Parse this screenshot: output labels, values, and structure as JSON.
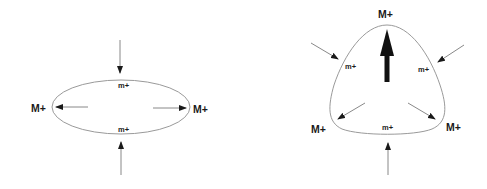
{
  "diagram": {
    "left_panel": {
      "shape": "ellipse",
      "labels": {
        "major_left": "M+",
        "major_right": "M+",
        "minor_top": "m+",
        "minor_bottom": "m+"
      },
      "arrows": [
        {
          "name": "compress-top",
          "direction": "inward"
        },
        {
          "name": "compress-bottom",
          "direction": "inward"
        },
        {
          "name": "expand-left",
          "direction": "outward"
        },
        {
          "name": "expand-right",
          "direction": "outward"
        }
      ]
    },
    "right_panel": {
      "shape": "rounded-triangle",
      "labels": {
        "major_top": "M+",
        "major_bottom_left": "M+",
        "major_bottom_right": "M+",
        "minor_left": "m+",
        "minor_right": "m+",
        "minor_bottom": "m+"
      },
      "arrows": [
        {
          "name": "thick-up",
          "direction": "outward",
          "style": "bold"
        },
        {
          "name": "compress-top-left",
          "direction": "inward"
        },
        {
          "name": "compress-top-right",
          "direction": "inward"
        },
        {
          "name": "compress-bottom",
          "direction": "inward"
        },
        {
          "name": "expand-bottom-left",
          "direction": "outward"
        },
        {
          "name": "expand-bottom-right",
          "direction": "outward"
        }
      ]
    },
    "colors": {
      "outline": "#9a9a9a",
      "arrow": "#7a7a7a",
      "arrowhead": "#1a1a1a",
      "text": "#1a1a1a"
    }
  }
}
